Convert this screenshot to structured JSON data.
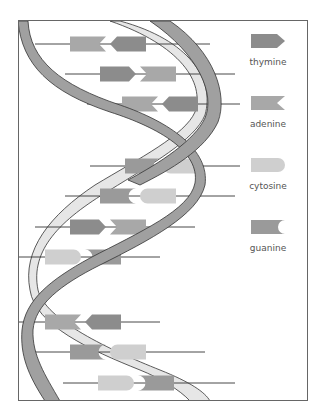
{
  "legend": {
    "items": [
      {
        "label": "thymine",
        "shape": "arrow-point-right",
        "color": "#8c8c8c"
      },
      {
        "label": "adenine",
        "shape": "notch-left",
        "color": "#a8a8a8"
      },
      {
        "label": "cytosine",
        "shape": "rounded-right",
        "color": "#cfcfcf"
      },
      {
        "label": "guanine",
        "shape": "notch-right",
        "color": "#9a9a9a"
      }
    ]
  },
  "colors": {
    "thymine": "#8c8c8c",
    "adenine": "#a8a8a8",
    "cytosine": "#cfcfcf",
    "guanine": "#9a9a9a",
    "strand_front": "#a0a0a0",
    "strand_back": "#e6e6e6",
    "outline": "#333333"
  },
  "base_pairs": [
    {
      "y": 44,
      "left": "adenine",
      "right": "thymine"
    },
    {
      "y": 74,
      "left": "thymine",
      "right": "adenine"
    },
    {
      "y": 104,
      "left": "adenine",
      "right": "thymine"
    },
    {
      "y": 166,
      "left": "guanine",
      "right": "cytosine"
    },
    {
      "y": 196,
      "left": "guanine",
      "right": "cytosine"
    },
    {
      "y": 227,
      "left": "thymine",
      "right": "adenine"
    },
    {
      "y": 257,
      "left": "cytosine",
      "right": "guanine"
    },
    {
      "y": 322,
      "left": "adenine",
      "right": "thymine"
    },
    {
      "y": 352,
      "left": "guanine",
      "right": "cytosine"
    },
    {
      "y": 383,
      "left": "cytosine",
      "right": "guanine"
    }
  ]
}
